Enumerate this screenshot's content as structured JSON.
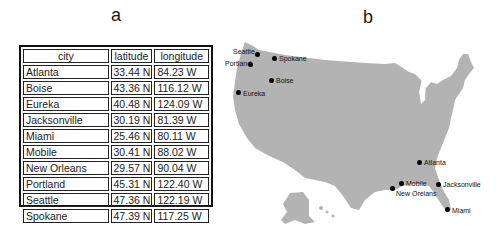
{
  "panels": {
    "a": {
      "label": "a"
    },
    "b": {
      "label": "b"
    }
  },
  "table": {
    "headers": [
      "city",
      "latitude",
      "longitude"
    ],
    "rows": [
      [
        "Atlanta",
        "33.44 N",
        "84.23 W"
      ],
      [
        "Boise",
        "43.36 N",
        "116.12 W"
      ],
      [
        "Eureka",
        "40.48 N",
        "124.09 W"
      ],
      [
        "Jacksonville",
        "30.19 N",
        "81.39 W"
      ],
      [
        "Miami",
        "25.46 N",
        "80.11 W"
      ],
      [
        "Mobile",
        "30.41 N",
        "88.02 W"
      ],
      [
        "New Orleans",
        "29.57 N",
        "90.04 W"
      ],
      [
        "Portland",
        "45.31 N",
        "122.40 W"
      ],
      [
        "Seattle",
        "47.36 N",
        "122.19 W"
      ],
      [
        "Spokane",
        "47.39 N",
        "117.25 W"
      ]
    ]
  },
  "map": {
    "fill_color": "#b3b3b3",
    "dot_color": "#000000",
    "cities": [
      {
        "name": "Seattle",
        "dot": [
          32,
          34
        ],
        "label": [
          8,
          28
        ]
      },
      {
        "name": "Portland",
        "dot": [
          25,
          44
        ],
        "label": [
          0,
          40
        ]
      },
      {
        "name": "Spokane",
        "dot": [
          49,
          38
        ],
        "label": [
          54,
          35
        ]
      },
      {
        "name": "Boise",
        "dot": [
          46,
          60
        ],
        "label": [
          51,
          57
        ]
      },
      {
        "name": "Eureka",
        "dot": [
          13,
          72
        ],
        "label": [
          18,
          70
        ]
      },
      {
        "name": "Atlanta",
        "dot": [
          194,
          142
        ],
        "label": [
          199,
          139
        ]
      },
      {
        "name": "Mobile",
        "dot": [
          176,
          163
        ],
        "label": [
          181,
          160
        ]
      },
      {
        "name": "New Orelans",
        "dot": [
          167,
          168
        ],
        "label": [
          171,
          170
        ]
      },
      {
        "name": "Jacksonville",
        "dot": [
          213,
          164
        ],
        "label": [
          218,
          161
        ]
      },
      {
        "name": "Miami",
        "dot": [
          222,
          189
        ],
        "label": [
          227,
          187
        ]
      }
    ]
  }
}
